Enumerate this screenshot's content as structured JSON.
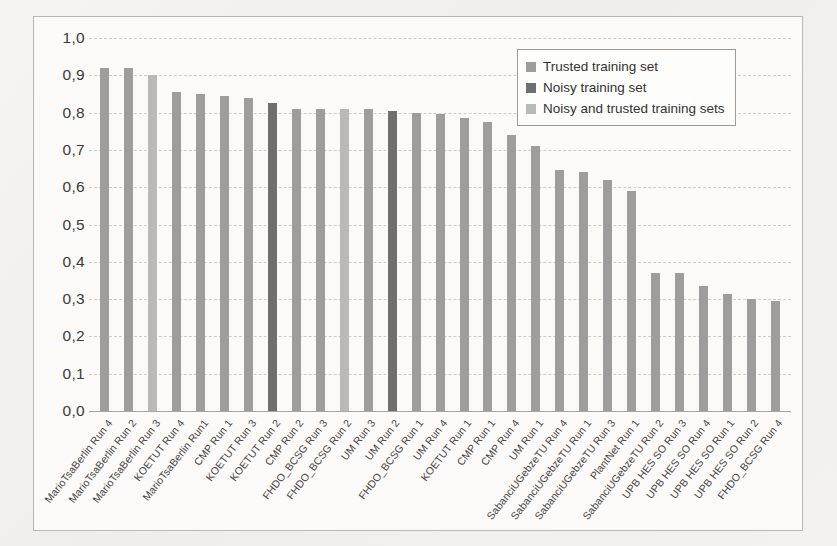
{
  "chart_data": {
    "type": "bar",
    "title": "",
    "xlabel": "",
    "ylabel": "",
    "ylim": [
      0.0,
      1.0
    ],
    "ytick_labels": [
      "1,0",
      "0,9",
      "0,8",
      "0,7",
      "0,6",
      "0,5",
      "0,4",
      "0,3",
      "0,2",
      "0,1",
      "0,0"
    ],
    "ytick_values": [
      1.0,
      0.9,
      0.8,
      0.7,
      0.6,
      0.5,
      0.4,
      0.3,
      0.2,
      0.1,
      0.0
    ],
    "grid": true,
    "legend_position": "upper-right",
    "decimal_separator": ",",
    "categories": [
      "MarioTsaBerlin Run 4",
      "MarioTsaBerlin Run 2",
      "MarioTsaBerlin Run 3",
      "KOETUT Run 4",
      "MarioTsaBerlin Run1",
      "CMP Run 1",
      "KOETUT Run 3",
      "KOETUT Run 2",
      "CMP Run 2",
      "FHDO_BCSG Run 3",
      "FHDO_BCSG Run 2",
      "UM Run 3",
      "UM Run 2",
      "FHDO_BCSG Run 1",
      "UM Run 4",
      "KOETUT Run 1",
      "CMP Run 1",
      "CMP Run 4",
      "UM Run 1",
      "SabanciUGebzeTU Run 4",
      "SabanciUGebzeTU Run 1",
      "SabanciUGebzeTU Run 3",
      "PlantNet Run 1",
      "SabanciUGebzeTU Run 2",
      "UPB HES SO Run 3",
      "UPB HES SO Run 4",
      "UPB HES SO Run 1",
      "UPB HES SO Run 2",
      "FHDO_BCSG Run 4"
    ],
    "values": [
      0.92,
      0.92,
      0.9,
      0.855,
      0.85,
      0.845,
      0.84,
      0.825,
      0.81,
      0.81,
      0.81,
      0.81,
      0.805,
      0.8,
      0.795,
      0.785,
      0.775,
      0.74,
      0.71,
      0.645,
      0.64,
      0.62,
      0.59,
      0.37,
      0.37,
      0.335,
      0.315,
      0.3,
      0.295
    ],
    "series_of_bar": [
      "trusted",
      "trusted",
      "both",
      "trusted",
      "trusted",
      "trusted",
      "trusted",
      "noisy",
      "trusted",
      "trusted",
      "both",
      "trusted",
      "noisy",
      "trusted",
      "trusted",
      "trusted",
      "trusted",
      "trusted",
      "trusted",
      "trusted",
      "trusted",
      "trusted",
      "trusted",
      "trusted",
      "trusted",
      "trusted",
      "trusted",
      "trusted",
      "trusted"
    ]
  },
  "legend": {
    "items": [
      {
        "label": "Trusted training set",
        "key": "trusted",
        "color": "#9d9d9d"
      },
      {
        "label": "Noisy training set",
        "key": "noisy",
        "color": "#6f6f6f"
      },
      {
        "label": "Noisy and trusted training sets",
        "key": "both",
        "color": "#b9b9b9"
      }
    ]
  },
  "colors": {
    "trusted": "#9d9d9d",
    "noisy": "#6f6f6f",
    "both": "#b9b9b9",
    "grid": "#cfcdc7",
    "axis": "#a8a6a1",
    "text": "#3b3a38",
    "plot_background": "#fbfaf8",
    "page_background": "#f2f1ee"
  }
}
